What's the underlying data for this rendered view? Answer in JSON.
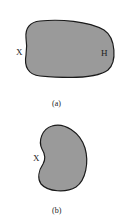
{
  "figure": {
    "panels": [
      {
        "caption": "(a)",
        "labels": {
          "left": "X",
          "right": "H"
        }
      },
      {
        "caption": "(b)",
        "labels": {
          "left": "X"
        }
      }
    ],
    "colors": {
      "fill": "#9a9a9a",
      "stroke": "#1a1a1a",
      "text": "#222222"
    }
  }
}
